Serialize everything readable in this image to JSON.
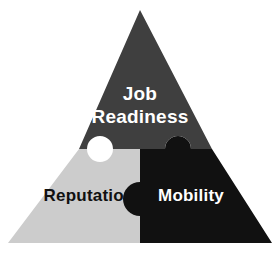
{
  "diagram": {
    "type": "triangle-puzzle",
    "background_color": "#ffffff",
    "pieces": [
      {
        "id": "job-readiness",
        "label_line1": "Job",
        "label_line2": "Readiness",
        "fill_color": "#3f3f3f",
        "text_color": "#ffffff",
        "position": "top"
      },
      {
        "id": "reputation",
        "label": "Reputation",
        "fill_color": "#cccccc",
        "text_color": "#111111",
        "position": "bottom-left"
      },
      {
        "id": "mobility",
        "label": "Mobility",
        "fill_color": "#111111",
        "text_color": "#ffffff",
        "position": "bottom-right"
      }
    ]
  }
}
